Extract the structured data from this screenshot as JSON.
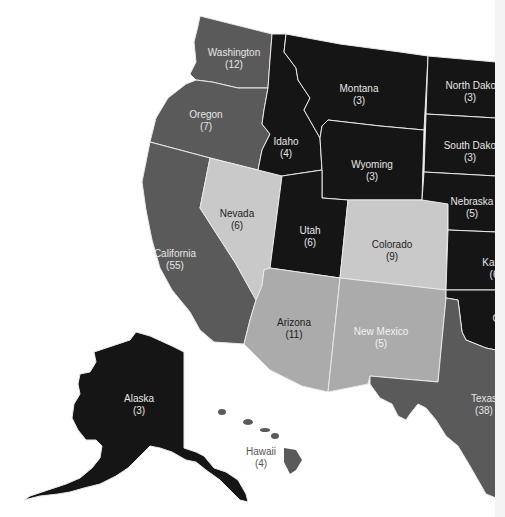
{
  "map": {
    "title": "Western US Electoral Votes",
    "colors": {
      "dark": "#151515",
      "dark_gray": "#5a5a5a",
      "medium_gray": "#ababab",
      "light_gray": "#c9c9c9",
      "border": "#e8e8e8",
      "background": "#ffffff"
    },
    "states": [
      {
        "name": "Washington",
        "votes": "(12)",
        "shade": "dark_gray",
        "text_color": "#e6e6e6"
      },
      {
        "name": "Oregon",
        "votes": "(7)",
        "shade": "dark_gray",
        "text_color": "#e6e6e6"
      },
      {
        "name": "California",
        "votes": "(55)",
        "shade": "dark_gray",
        "text_color": "#e6e6e6"
      },
      {
        "name": "Idaho",
        "votes": "(4)",
        "shade": "dark",
        "text_color": "#e6e6e6"
      },
      {
        "name": "Montana",
        "votes": "(3)",
        "shade": "dark",
        "text_color": "#e6e6e6"
      },
      {
        "name": "Wyoming",
        "votes": "(3)",
        "shade": "dark",
        "text_color": "#e6e6e6"
      },
      {
        "name": "Nevada",
        "votes": "(6)",
        "shade": "light_gray",
        "text_color": "#222222"
      },
      {
        "name": "Utah",
        "votes": "(6)",
        "shade": "dark",
        "text_color": "#e6e6e6"
      },
      {
        "name": "Colorado",
        "votes": "(9)",
        "shade": "light_gray",
        "text_color": "#222222"
      },
      {
        "name": "Arizona",
        "votes": "(11)",
        "shade": "medium_gray",
        "text_color": "#222222"
      },
      {
        "name": "New Mexico",
        "votes": "(5)",
        "shade": "medium_gray",
        "text_color": "#f2f2f2"
      },
      {
        "name": "North Dakota",
        "votes": "(3)",
        "shade": "dark",
        "text_color": "#e6e6e6"
      },
      {
        "name": "South Dakota",
        "votes": "(3)",
        "shade": "dark",
        "text_color": "#e6e6e6"
      },
      {
        "name": "Nebraska",
        "votes": "(5)",
        "shade": "dark",
        "text_color": "#e6e6e6"
      },
      {
        "name": "Kansas",
        "votes": "(6)",
        "label_visible": "Kar",
        "votes_visible": "(6",
        "shade": "dark",
        "text_color": "#e6e6e6"
      },
      {
        "name": "Oklahoma",
        "votes": "",
        "label_visible": "C",
        "shade": "dark",
        "text_color": "#e6e6e6"
      },
      {
        "name": "Texas",
        "votes": "(38)",
        "shade": "dark_gray",
        "text_color": "#e6e6e6"
      },
      {
        "name": "Alaska",
        "votes": "(3)",
        "shade": "dark",
        "text_color": "#e6e6e6"
      },
      {
        "name": "Hawaii",
        "votes": "(4)",
        "shade": "dark_gray",
        "text_color": "#555555"
      }
    ]
  }
}
